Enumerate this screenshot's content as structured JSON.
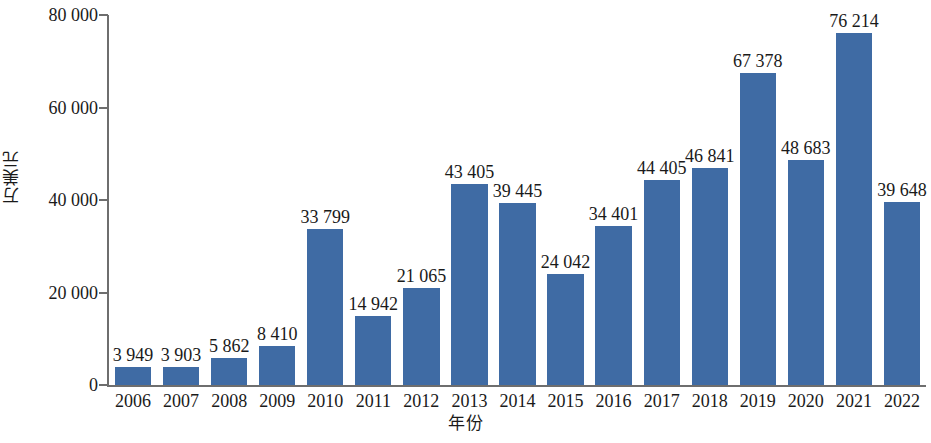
{
  "chart_data": {
    "type": "bar",
    "title": "",
    "xlabel": "年份",
    "ylabel": "万美元",
    "ylim": [
      0,
      80000
    ],
    "ytick_values": [
      0,
      20000,
      40000,
      60000,
      80000
    ],
    "ytick_labels": [
      "0",
      "20 000",
      "40 000",
      "60 000",
      "80 000"
    ],
    "grid": false,
    "legend": null,
    "bar_color": "#3f6ba4",
    "axis_color": "#6e6e6e",
    "categories": [
      "2006",
      "2007",
      "2008",
      "2009",
      "2010",
      "2011",
      "2012",
      "2013",
      "2014",
      "2015",
      "2016",
      "2017",
      "2018",
      "2019",
      "2020",
      "2021",
      "2022"
    ],
    "values": [
      3949,
      3903,
      5862,
      8410,
      33799,
      14942,
      21065,
      43405,
      39445,
      24042,
      34401,
      44405,
      46841,
      67378,
      48683,
      76214,
      39648
    ],
    "value_labels": [
      "3 949",
      "3 903",
      "5 862",
      "8 410",
      "33 799",
      "14 942",
      "21 065",
      "43 405",
      "39 445",
      "24 042",
      "34 401",
      "44 405",
      "46 841",
      "67 378",
      "48 683",
      "76 214",
      "39 648"
    ]
  }
}
